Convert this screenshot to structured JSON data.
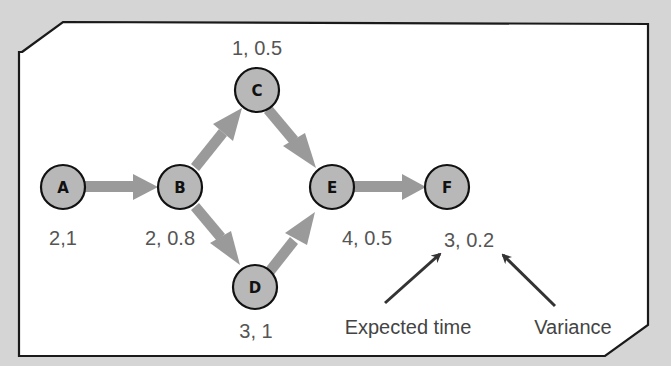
{
  "diagram": {
    "type": "PERT activity network",
    "colors": {
      "background": "#d5d5d5",
      "panel": "#ffffff",
      "panel_border": "#1a1a1a",
      "node_fill": "#b8b8b8",
      "node_stroke": "#111111",
      "edge": "#9a9a9a",
      "label_text": "#555555",
      "annotation_arrow": "#333333"
    },
    "nodes": [
      {
        "id": "A",
        "label": "A",
        "x": 63,
        "y": 187,
        "values": "2,1"
      },
      {
        "id": "B",
        "label": "B",
        "x": 180,
        "y": 187,
        "values": "2, 0.8"
      },
      {
        "id": "C",
        "label": "C",
        "x": 257,
        "y": 90,
        "values": "1, 0.5"
      },
      {
        "id": "D",
        "label": "D",
        "x": 255,
        "y": 287,
        "values": "3, 1"
      },
      {
        "id": "E",
        "label": "E",
        "x": 332,
        "y": 187,
        "values": "4, 0.5"
      },
      {
        "id": "F",
        "label": "F",
        "x": 447,
        "y": 187,
        "values": "3, 0.2"
      }
    ],
    "edges": [
      {
        "from": "A",
        "to": "B"
      },
      {
        "from": "B",
        "to": "C"
      },
      {
        "from": "B",
        "to": "D"
      },
      {
        "from": "C",
        "to": "E"
      },
      {
        "from": "D",
        "to": "E"
      },
      {
        "from": "E",
        "to": "F"
      }
    ],
    "annotations": {
      "expected_time": "Expected time",
      "variance": "Variance"
    }
  }
}
